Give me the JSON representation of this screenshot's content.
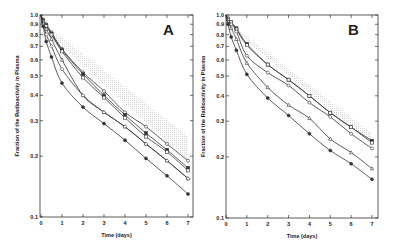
{
  "chart_data": [
    {
      "type": "line",
      "panel": "A",
      "title": "",
      "xlabel": "Time (days)",
      "ylabel": "Fraction of the Radioactivity in Plasma",
      "yscale": "log",
      "xlim": [
        0,
        7
      ],
      "ylim": [
        0.1,
        1.0
      ],
      "x_ticks": [
        0,
        1,
        2,
        3,
        4,
        5,
        6,
        7
      ],
      "y_ticks": [
        0.1,
        0.2,
        0.3,
        0.4,
        0.5,
        0.6,
        0.7,
        0.8,
        0.9,
        1.0
      ],
      "y_tick_labels": [
        "0.1",
        "0.2",
        "0.3",
        "0.4",
        "0.5",
        "0.6",
        "0.7",
        "0.8",
        "0.9",
        "1.0"
      ],
      "grid": false,
      "shaded_band": {
        "x": [
          0.5,
          7
        ],
        "upper": [
          0.85,
          0.25
        ],
        "lower": [
          0.78,
          0.19
        ]
      },
      "x": [
        0,
        0.1,
        0.25,
        0.5,
        1,
        2,
        3,
        4,
        5,
        6,
        7
      ],
      "series": [
        {
          "name": "open circle",
          "marker": "open-circle",
          "values": [
            1.0,
            0.95,
            0.9,
            0.82,
            0.68,
            0.52,
            0.42,
            0.33,
            0.28,
            0.23,
            0.19
          ]
        },
        {
          "name": "filled square",
          "marker": "filled-square",
          "values": [
            1.0,
            0.94,
            0.89,
            0.81,
            0.67,
            0.51,
            0.4,
            0.32,
            0.26,
            0.215,
            0.175
          ]
        },
        {
          "name": "open square",
          "marker": "open-square",
          "values": [
            1.0,
            0.93,
            0.88,
            0.8,
            0.66,
            0.49,
            0.39,
            0.31,
            0.25,
            0.21,
            0.17
          ]
        },
        {
          "name": "open triangle",
          "marker": "open-triangle",
          "values": [
            1.0,
            0.92,
            0.85,
            0.76,
            0.6,
            0.4,
            0.33,
            0.28,
            0.23,
            0.19,
            0.155
          ]
        },
        {
          "name": "open diamond",
          "marker": "open-diamond",
          "values": [
            1.0,
            0.9,
            0.8,
            0.7,
            0.54,
            0.4,
            0.33,
            0.28,
            0.23,
            0.19,
            0.155
          ]
        },
        {
          "name": "filled circle",
          "marker": "filled-circle",
          "values": [
            1.0,
            0.88,
            0.74,
            0.62,
            0.46,
            0.35,
            0.29,
            0.24,
            0.195,
            0.16,
            0.13
          ]
        }
      ],
      "annotation": "A"
    },
    {
      "type": "line",
      "panel": "B",
      "title": "",
      "xlabel": "Time (days)",
      "ylabel": "Fraction of the Radioactivity in Plasma",
      "yscale": "log",
      "xlim": [
        0,
        7
      ],
      "ylim": [
        0.1,
        1.0
      ],
      "x_ticks": [
        0,
        1,
        2,
        3,
        4,
        5,
        6,
        7
      ],
      "y_ticks": [
        0.1,
        0.2,
        0.3,
        0.4,
        0.5,
        0.6,
        0.7,
        0.8,
        0.9,
        1.0
      ],
      "y_tick_labels": [
        "0.1",
        "0.2",
        "0.3",
        "0.4",
        "0.5",
        "0.6",
        "0.7",
        "0.8",
        "0.9",
        "1.0"
      ],
      "grid": false,
      "shaded_band": {
        "x": [
          0.5,
          7
        ],
        "upper": [
          0.86,
          0.26
        ],
        "lower": [
          0.82,
          0.23
        ]
      },
      "x": [
        0,
        0.1,
        0.25,
        0.5,
        1,
        2,
        3,
        4,
        5,
        6,
        7
      ],
      "series": [
        {
          "name": "filled square",
          "marker": "filled-square",
          "values": [
            1.0,
            0.96,
            0.92,
            0.86,
            0.72,
            0.57,
            0.48,
            0.4,
            0.33,
            0.28,
            0.24
          ]
        },
        {
          "name": "open square",
          "marker": "open-square",
          "values": [
            1.0,
            0.96,
            0.92,
            0.85,
            0.71,
            0.57,
            0.48,
            0.4,
            0.33,
            0.28,
            0.235
          ]
        },
        {
          "name": "open circle",
          "marker": "open-circle",
          "values": [
            1.0,
            0.95,
            0.9,
            0.83,
            0.63,
            0.52,
            0.45,
            0.37,
            0.315,
            0.26,
            0.22
          ]
        },
        {
          "name": "open triangle",
          "marker": "open-triangle",
          "values": [
            1.0,
            0.93,
            0.86,
            0.76,
            0.58,
            0.44,
            0.36,
            0.31,
            0.245,
            0.21,
            0.175
          ]
        },
        {
          "name": "filled circle",
          "marker": "filled-circle",
          "values": [
            1.0,
            0.9,
            0.78,
            0.67,
            0.51,
            0.39,
            0.32,
            0.26,
            0.215,
            0.185,
            0.155
          ]
        }
      ],
      "annotation": "B"
    }
  ],
  "panels": [
    {
      "letter": "A",
      "xlabel": "Time (days)",
      "ylabel": "Fraction of the Radioactivity in Plasma"
    },
    {
      "letter": "B",
      "xlabel": "Time (days)",
      "ylabel": "Fraction of the Radioactivity in Plasma"
    }
  ],
  "colors": {
    "line": "#333333",
    "band": "#d6d6d6",
    "axis": "#333333"
  }
}
